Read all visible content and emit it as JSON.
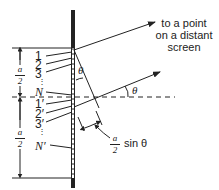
{
  "diagram": {
    "caption": [
      "to a point",
      "on a distant",
      "screen"
    ],
    "upper_labels": [
      "1",
      "2",
      "3",
      "N"
    ],
    "lower_labels": [
      "1′",
      "2′",
      "3′",
      "N′"
    ],
    "half_width": {
      "numerator": "a",
      "denominator": "2"
    },
    "path_difference": {
      "numerator": "a",
      "denominator": "2",
      "suffix": "sin θ"
    },
    "angle_label": "θ",
    "colors": {
      "ink": "#222222",
      "background": "#ffffff"
    }
  }
}
